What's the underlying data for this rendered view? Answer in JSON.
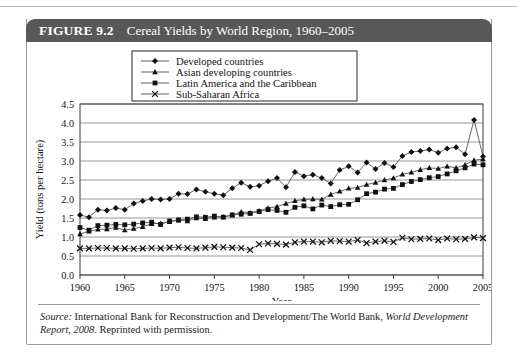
{
  "figure": {
    "label": "FIGURE 9.2",
    "title": "Cereal Yields by World Region, 1960–2005"
  },
  "source": {
    "prefix": "Source:",
    "body": " International Bank for Reconstruction and Development/The World Bank, ",
    "italic_title": "World Development Report, 2008",
    "suffix": ". Reprinted with permission."
  },
  "chart_data": {
    "type": "line",
    "title": "Cereal Yields by World Region, 1960–2005",
    "xlabel": "Year",
    "ylabel": "Yield (tons per hectare)",
    "xlim": [
      1960,
      2005
    ],
    "ylim": [
      0.0,
      4.5
    ],
    "ytick_step": 0.5,
    "xtick_step": 5,
    "grid": "horizontal",
    "legend_position": "top-center",
    "xticks": [
      1960,
      1965,
      1970,
      1975,
      1980,
      1985,
      1990,
      1995,
      2000,
      2005
    ],
    "yticks": [
      "0.0",
      "0.5",
      "1.0",
      "1.5",
      "2.0",
      "2.5",
      "3.0",
      "3.5",
      "4.0",
      "4.5"
    ],
    "x": [
      1960,
      1961,
      1962,
      1963,
      1964,
      1965,
      1966,
      1967,
      1968,
      1969,
      1970,
      1971,
      1972,
      1973,
      1974,
      1975,
      1976,
      1977,
      1978,
      1979,
      1980,
      1981,
      1982,
      1983,
      1984,
      1985,
      1986,
      1987,
      1988,
      1989,
      1990,
      1991,
      1992,
      1993,
      1994,
      1995,
      1996,
      1997,
      1998,
      1999,
      2000,
      2001,
      2002,
      2003,
      2004,
      2005
    ],
    "series": [
      {
        "name": "Developed countries",
        "marker": "diamond",
        "values": [
          1.58,
          1.52,
          1.72,
          1.7,
          1.76,
          1.72,
          1.88,
          1.95,
          2.0,
          1.99,
          2.0,
          2.14,
          2.13,
          2.25,
          2.19,
          2.14,
          2.1,
          2.28,
          2.43,
          2.32,
          2.35,
          2.47,
          2.55,
          2.31,
          2.71,
          2.6,
          2.64,
          2.55,
          2.41,
          2.76,
          2.86,
          2.7,
          2.96,
          2.79,
          2.95,
          2.84,
          3.13,
          3.24,
          3.26,
          3.3,
          3.22,
          3.33,
          3.36,
          3.18,
          4.08,
          3.12
        ]
      },
      {
        "name": "Asian developing countries",
        "marker": "triangle",
        "values": [
          1.08,
          1.15,
          1.2,
          1.21,
          1.25,
          1.18,
          1.22,
          1.27,
          1.35,
          1.36,
          1.4,
          1.44,
          1.42,
          1.5,
          1.48,
          1.52,
          1.53,
          1.58,
          1.66,
          1.64,
          1.69,
          1.76,
          1.8,
          1.88,
          1.95,
          1.99,
          2.0,
          1.99,
          2.12,
          2.2,
          2.28,
          2.3,
          2.38,
          2.43,
          2.5,
          2.55,
          2.65,
          2.7,
          2.77,
          2.82,
          2.8,
          2.86,
          2.82,
          2.9,
          3.02,
          3.05
        ]
      },
      {
        "name": "Latin America and the Caribbean",
        "marker": "square",
        "values": [
          1.25,
          1.18,
          1.3,
          1.31,
          1.33,
          1.32,
          1.34,
          1.37,
          1.39,
          1.33,
          1.42,
          1.45,
          1.47,
          1.53,
          1.52,
          1.55,
          1.52,
          1.58,
          1.6,
          1.62,
          1.67,
          1.72,
          1.7,
          1.65,
          1.78,
          1.82,
          1.74,
          1.84,
          1.8,
          1.85,
          1.86,
          1.98,
          2.14,
          2.18,
          2.26,
          2.28,
          2.38,
          2.46,
          2.51,
          2.56,
          2.59,
          2.66,
          2.74,
          2.82,
          2.92,
          2.9
        ]
      },
      {
        "name": "Sub-Saharan Africa",
        "marker": "cross",
        "values": [
          0.7,
          0.7,
          0.71,
          0.71,
          0.7,
          0.7,
          0.69,
          0.7,
          0.71,
          0.7,
          0.72,
          0.73,
          0.71,
          0.7,
          0.72,
          0.74,
          0.73,
          0.72,
          0.71,
          0.66,
          0.81,
          0.83,
          0.82,
          0.8,
          0.86,
          0.88,
          0.88,
          0.86,
          0.9,
          0.89,
          0.88,
          0.92,
          0.84,
          0.88,
          0.9,
          0.87,
          0.98,
          0.94,
          0.95,
          0.96,
          0.92,
          0.96,
          0.94,
          0.95,
          0.99,
          0.97
        ]
      }
    ]
  }
}
